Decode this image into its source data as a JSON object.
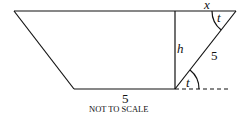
{
  "diagram": {
    "labels": {
      "x": "x",
      "t_top": "t",
      "t_bottom": "t",
      "h": "h",
      "slant_side": "5",
      "bottom_side": "5"
    },
    "note": "NOT TO SCALE",
    "colors": {
      "stroke": "#111111",
      "background": "#ffffff"
    }
  }
}
